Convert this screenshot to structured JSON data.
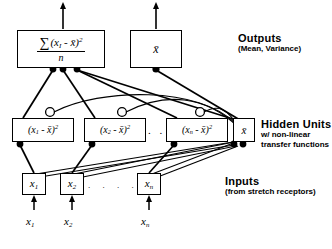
{
  "figure": {
    "type": "neural-network-diagram",
    "layers": {
      "outputs": {
        "caption_title": "Outputs",
        "caption_sub": "(Mean, Variance)",
        "units": [
          {
            "name": "variance-output",
            "sigma": "∑",
            "numerator_open": "(",
            "numerator_var": "x",
            "numerator_sub": "I",
            "numerator_minus": " - ",
            "numerator_mean": "x̄",
            "numerator_close": ")",
            "numerator_exp": "2",
            "denominator": "n"
          },
          {
            "name": "mean-output",
            "label": "x̄"
          }
        ]
      },
      "hidden": {
        "caption_title": "Hidden Units",
        "caption_sub_line1": "w/ non-linear",
        "caption_sub_line2": "transfer functions",
        "ellipsis": ". . .",
        "units": [
          {
            "name": "hidden-unit-1",
            "open": "(",
            "var": "x",
            "sub": "1",
            "minus": " - ",
            "mean": "x̄",
            "close": ")",
            "exp": "2"
          },
          {
            "name": "hidden-unit-2",
            "open": "(",
            "var": "x",
            "sub": "2",
            "minus": " - ",
            "mean": "x̄",
            "close": ")",
            "exp": "2"
          },
          {
            "name": "hidden-unit-n",
            "open": "(",
            "var": "x",
            "sub": "n",
            "minus": " - ",
            "mean": "x̄",
            "close": ")",
            "exp": "2"
          },
          {
            "name": "hidden-unit-mean",
            "label": "x̄"
          }
        ]
      },
      "inputs": {
        "caption_title": "Inputs",
        "caption_sub": "(from stretch receptors)",
        "ellipsis": ". . . .",
        "units": [
          {
            "name": "input-unit-1",
            "var": "x",
            "sub": "1"
          },
          {
            "name": "input-unit-2",
            "var": "x",
            "sub": "2"
          },
          {
            "name": "input-unit-n",
            "var": "x",
            "sub": "n"
          }
        ],
        "signal_labels": [
          {
            "name": "input-signal-1",
            "var": "x",
            "sub": "1"
          },
          {
            "name": "input-signal-2",
            "var": "x",
            "sub": "2"
          },
          {
            "name": "input-signal-n",
            "var": "x",
            "sub": "n"
          }
        ]
      }
    },
    "colors": {
      "stroke": "#000000",
      "background": "#ffffff"
    }
  }
}
